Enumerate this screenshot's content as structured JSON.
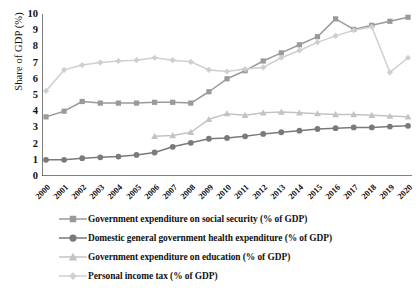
{
  "chart_data": {
    "type": "line",
    "title": "",
    "xlabel": "",
    "ylabel": "Share of GDP (%)",
    "ylim": [
      0,
      10
    ],
    "yticks": [
      0,
      1,
      2,
      3,
      4,
      5,
      6,
      7,
      8,
      9,
      10
    ],
    "grid": false,
    "legend_position": "below",
    "x": [
      "2000",
      "2001",
      "2002",
      "2003",
      "2004",
      "2005",
      "2006",
      "2007",
      "2008",
      "2009",
      "2010",
      "2011",
      "2012",
      "2013",
      "2014",
      "2015",
      "2016",
      "2017",
      "2018",
      "2019",
      "2020"
    ],
    "series": [
      {
        "name": "Government expenditure on social security (% of GDP)",
        "marker": "square",
        "color": "#9a9a9a",
        "values": [
          3.65,
          4.0,
          4.6,
          4.5,
          4.5,
          4.5,
          4.55,
          4.55,
          4.5,
          5.2,
          6.0,
          6.5,
          7.1,
          7.6,
          8.1,
          8.6,
          9.7,
          9.05,
          9.3,
          9.55,
          9.8
        ]
      },
      {
        "name": "Domestic general government health expenditure (% of GDP)",
        "marker": "circle",
        "color": "#7a7a7a",
        "values": [
          1.0,
          1.0,
          1.1,
          1.15,
          1.2,
          1.3,
          1.45,
          1.8,
          2.05,
          2.3,
          2.35,
          2.45,
          2.6,
          2.7,
          2.8,
          2.9,
          2.95,
          3.0,
          3.0,
          3.05,
          3.1
        ]
      },
      {
        "name": "Government expenditure on education (% of GDP)",
        "marker": "triangle",
        "color": "#c3c3c3",
        "values": [
          null,
          null,
          null,
          null,
          null,
          null,
          2.45,
          2.5,
          2.7,
          3.5,
          3.85,
          3.75,
          3.9,
          3.95,
          3.9,
          3.85,
          3.8,
          3.8,
          3.75,
          3.7,
          3.65
        ]
      },
      {
        "name": "Personal income tax (% of GDP)",
        "marker": "diamond",
        "color": "#cfcfcf",
        "values": [
          5.25,
          6.55,
          6.85,
          7.0,
          7.1,
          7.15,
          7.3,
          7.15,
          7.05,
          6.55,
          6.45,
          6.6,
          6.7,
          7.3,
          7.75,
          8.25,
          8.65,
          9.0,
          9.2,
          6.4,
          7.3
        ]
      }
    ]
  },
  "legend": {
    "items": [
      {
        "label": "Government expenditure on social security (% of GDP)"
      },
      {
        "label": "Domestic general government health expenditure (% of GDP)"
      },
      {
        "label": "Government expenditure on education (% of GDP)"
      },
      {
        "label": "Personal income tax (% of GDP)"
      }
    ]
  }
}
